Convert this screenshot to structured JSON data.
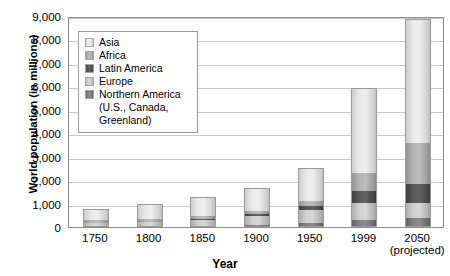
{
  "chart_data": {
    "type": "bar",
    "subtype": "stacked-bar",
    "title": "",
    "xlabel": "Year",
    "ylabel": "World population (in millions)",
    "ylim": [
      0,
      9000
    ],
    "ytick_values": [
      0,
      1000,
      2000,
      3000,
      4000,
      5000,
      6000,
      7000,
      8000,
      9000
    ],
    "ytick_labels": [
      "0",
      "1,000",
      "2,000",
      "3,000",
      "4,000",
      "5,000",
      "6,000",
      "7,000",
      "8,000",
      "9,000"
    ],
    "grid": true,
    "legend_position": "inside-upper-left",
    "categories": [
      "1750",
      "1800",
      "1850",
      "1900",
      "1950",
      "1999",
      "2050"
    ],
    "category_sublabels": [
      "",
      "",
      "",
      "",
      "",
      "",
      "(projected)"
    ],
    "series": [
      {
        "name": "Northern America (U.S., Canada, Greenland)",
        "short_name": "Northern America",
        "color": "#757575",
        "values": [
          2,
          7,
          26,
          82,
          172,
          307,
          392
        ]
      },
      {
        "name": "Europe",
        "color": "#c6c6c6",
        "values": [
          163,
          203,
          276,
          408,
          547,
          729,
          628
        ]
      },
      {
        "name": "Latin America",
        "color": "#4a4a4a",
        "values": [
          16,
          24,
          38,
          74,
          167,
          511,
          809
        ]
      },
      {
        "name": "Africa",
        "color": "#a8a8a8",
        "values": [
          106,
          107,
          111,
          133,
          221,
          767,
          1766
        ]
      },
      {
        "name": "Asia",
        "color": "#e0e0e0",
        "values": [
          502,
          635,
          809,
          947,
          1402,
          3634,
          5268
        ]
      }
    ],
    "totals": [
      789,
      976,
      1260,
      1644,
      2509,
      5948,
      8863
    ]
  },
  "axis": {
    "y_title": "World population (in millions)",
    "x_title": "Year"
  },
  "legend": {
    "items": [
      {
        "label": "Asia",
        "swatch": "asia-swatch"
      },
      {
        "label": "Africa",
        "swatch": "africa-swatch"
      },
      {
        "label": "Latin America",
        "swatch": "latin-america-swatch"
      },
      {
        "label": "Europe",
        "swatch": "europe-swatch"
      },
      {
        "label": "Northern America",
        "swatch": "northern-america-swatch"
      }
    ],
    "continuation_lines": [
      "(U.S., Canada,",
      "Greenland)"
    ]
  }
}
